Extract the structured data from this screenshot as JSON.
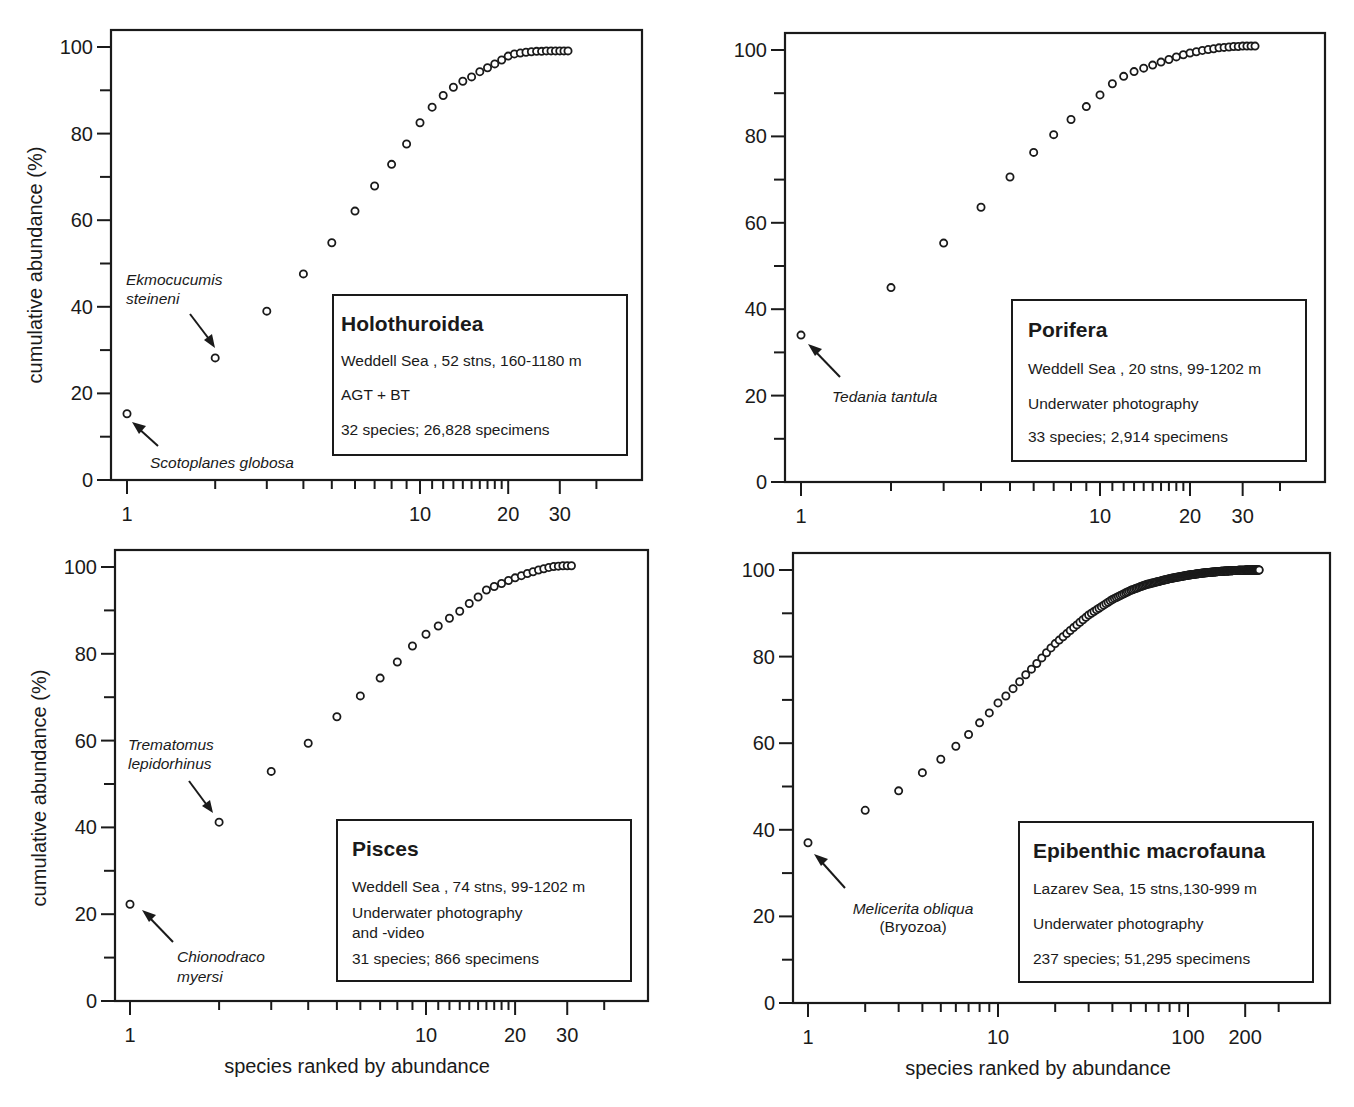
{
  "figure": {
    "x_axis_title": "species ranked by abundance",
    "y_axis_title": "cumulative abundance (%)"
  },
  "chart_data": [
    {
      "type": "scatter",
      "id": "holothuroidea",
      "title": "Holothuroidea",
      "info_lines": [
        "Weddell Sea , 52 stns, 160-1180 m",
        "AGT + BT",
        "32 species; 26,828 specimens"
      ],
      "xlabel": "",
      "ylabel": "cumulative abundance (%)",
      "x_scale": "log",
      "xlim": [
        0.92,
        58
      ],
      "ylim": [
        0,
        100
      ],
      "x_ticks_labeled": [
        1,
        10,
        20,
        30
      ],
      "y_ticks_labeled": [
        0,
        20,
        40,
        60,
        80,
        100
      ],
      "y_minor_step": 10,
      "grid": false,
      "x": [
        1,
        2,
        3,
        4,
        5,
        6,
        7,
        8,
        9,
        10,
        11,
        12,
        13,
        14,
        15,
        16,
        17,
        18,
        19,
        20,
        21,
        22,
        23,
        24,
        25,
        26,
        27,
        28,
        29,
        30,
        31,
        32
      ],
      "y": [
        15.3,
        28.2,
        39.0,
        47.6,
        54.8,
        62.1,
        67.9,
        72.9,
        77.6,
        82.5,
        86.1,
        88.8,
        90.7,
        92.1,
        93.1,
        94.3,
        95.2,
        96.1,
        97.0,
        97.9,
        98.4,
        98.6,
        98.8,
        98.9,
        99.0,
        99.0,
        99.1,
        99.1,
        99.1,
        99.1,
        99.1,
        99.1
      ],
      "annotations": [
        {
          "text": "Ekmocucumis",
          "text2": "steineni",
          "point": 2
        },
        {
          "text": "Scotoplanes globosa",
          "point": 1
        }
      ]
    },
    {
      "type": "scatter",
      "id": "porifera",
      "title": "Porifera",
      "info_lines": [
        "Weddell Sea , 20 stns, 99-1202 m",
        "Underwater photography",
        "33 species; 2,914 specimens"
      ],
      "xlabel": "",
      "ylabel": "",
      "x_scale": "log",
      "xlim": [
        0.9,
        58
      ],
      "ylim": [
        0,
        100
      ],
      "x_ticks_labeled": [
        1,
        10,
        20,
        30
      ],
      "y_ticks_labeled": [
        0,
        20,
        40,
        60,
        80,
        100
      ],
      "y_minor_step": 10,
      "grid": false,
      "x": [
        1,
        2,
        3,
        4,
        5,
        6,
        7,
        8,
        9,
        10,
        11,
        12,
        13,
        14,
        15,
        16,
        17,
        18,
        19,
        20,
        21,
        22,
        23,
        24,
        25,
        26,
        27,
        28,
        29,
        30,
        31,
        32,
        33
      ],
      "y": [
        34.0,
        45.0,
        55.3,
        63.6,
        70.6,
        76.3,
        80.4,
        83.9,
        86.9,
        89.6,
        92.2,
        93.9,
        95.0,
        95.8,
        96.5,
        97.2,
        97.8,
        98.4,
        98.9,
        99.3,
        99.6,
        99.9,
        100.1,
        100.3,
        100.5,
        100.6,
        100.7,
        100.8,
        100.8,
        100.9,
        100.9,
        100.9,
        100.9
      ],
      "annotations": [
        {
          "text": "Tedania tantula",
          "point": 1
        }
      ]
    },
    {
      "type": "scatter",
      "id": "pisces",
      "title": "Pisces",
      "info_lines": [
        "Weddell Sea , 74 stns, 99-1202 m",
        "Underwater photography",
        "and -video",
        "31 species; 866 specimens"
      ],
      "xlabel": "species ranked by abundance",
      "ylabel": "cumulative abundance (%)",
      "x_scale": "log",
      "xlim": [
        0.92,
        58
      ],
      "ylim": [
        0,
        100
      ],
      "x_ticks_labeled": [
        1,
        10,
        20,
        30
      ],
      "y_ticks_labeled": [
        0,
        20,
        40,
        60,
        80,
        100
      ],
      "y_minor_step": 10,
      "grid": false,
      "x": [
        1,
        2,
        3,
        4,
        5,
        6,
        7,
        8,
        9,
        10,
        11,
        12,
        13,
        14,
        15,
        16,
        17,
        18,
        19,
        20,
        21,
        22,
        23,
        24,
        25,
        26,
        27,
        28,
        29,
        30,
        31
      ],
      "y": [
        22.3,
        41.2,
        52.9,
        59.4,
        65.5,
        70.3,
        74.4,
        78.1,
        81.8,
        84.5,
        86.4,
        88.2,
        89.8,
        91.6,
        93.1,
        94.7,
        95.5,
        96.2,
        96.9,
        97.5,
        98.0,
        98.5,
        98.9,
        99.3,
        99.6,
        99.9,
        100.1,
        100.2,
        100.3,
        100.3,
        100.3
      ],
      "annotations": [
        {
          "text": "Trematomus",
          "text2": "lepidorhinus",
          "point": 2
        },
        {
          "text": "Chionodraco",
          "text2": "myersi",
          "point": 1
        }
      ]
    },
    {
      "type": "scatter",
      "id": "epibenthic",
      "title": "Epibenthic macrofauna",
      "info_lines": [
        "Lazarev Sea, 15 stns,130-999 m",
        "Underwater photography",
        "237 species; 51,295 specimens"
      ],
      "xlabel": "species ranked by abundance",
      "ylabel": "",
      "x_scale": "log",
      "xlim": [
        0.9,
        470
      ],
      "ylim": [
        0,
        100
      ],
      "x_ticks_labeled": [
        1,
        10,
        100,
        200
      ],
      "y_ticks_labeled": [
        0,
        20,
        40,
        60,
        80,
        100
      ],
      "y_minor_step": 10,
      "grid": false,
      "x_sample": [
        1,
        2,
        3,
        4,
        5,
        6,
        7,
        8,
        9,
        10,
        11,
        12,
        13,
        14,
        15,
        16,
        17,
        18,
        19,
        20,
        25,
        30,
        40,
        50,
        60,
        80,
        100,
        120,
        150,
        180,
        210,
        237
      ],
      "y_sample": [
        37.0,
        44.5,
        49.0,
        53.2,
        56.3,
        59.3,
        62.0,
        64.7,
        67.0,
        69.3,
        70.9,
        72.6,
        74.2,
        75.8,
        77.1,
        78.4,
        79.7,
        80.9,
        82.0,
        83.0,
        86.7,
        89.6,
        93.2,
        95.3,
        96.6,
        98.0,
        98.8,
        99.3,
        99.7,
        99.9,
        100.0,
        100.0
      ],
      "annotations": [
        {
          "text": "Melicerita obliqua",
          "text2": "(Bryozoa)",
          "point": 1
        }
      ]
    }
  ]
}
